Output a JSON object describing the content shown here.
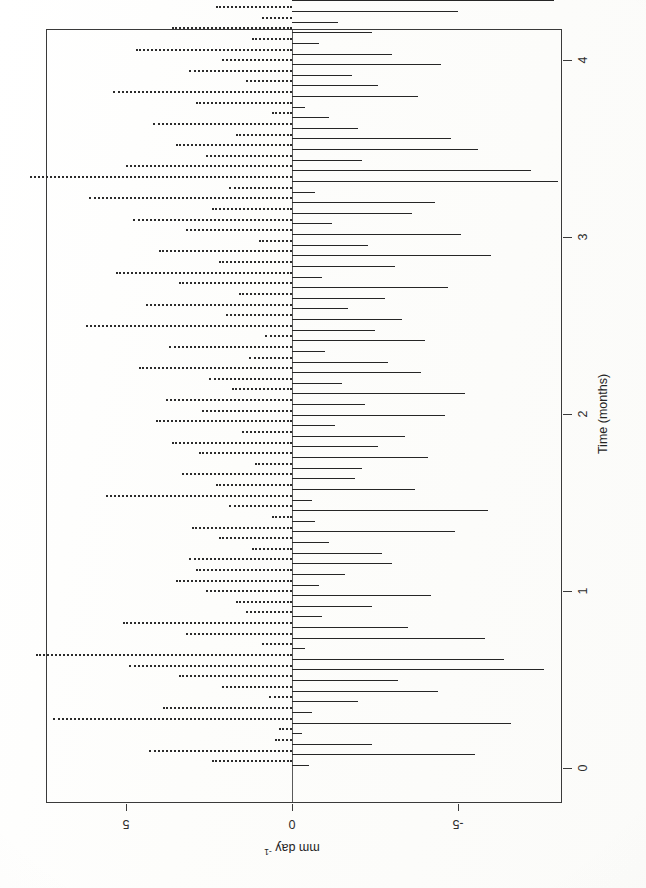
{
  "chart_data": {
    "type": "bar",
    "orientation": "horizontal-bars-rotated-page",
    "title": "",
    "subtitle": "",
    "xlabel": "mm day⁻¹",
    "ylabel": "Time (months)",
    "value_axis": {
      "name": "mm day-1",
      "label": "mm day⁻¹",
      "ticks": [
        5,
        0,
        -5
      ],
      "tick_labels": [
        "5",
        "0",
        "-5"
      ],
      "range": [
        7.8,
        -8.1
      ],
      "direction": "decreasing-left-to-right",
      "label_rotation_deg": 180
    },
    "time_axis": {
      "name": "Time (months)",
      "label": "Time (months)",
      "ticks": [
        0,
        1,
        2,
        3,
        4
      ],
      "tick_labels": [
        "0",
        "1",
        "2",
        "3",
        "4"
      ],
      "range": [
        -0.08,
        4.42
      ],
      "direction": "increasing-bottom-to-top",
      "label_rotation_deg": -90
    },
    "grid": false,
    "legend": null,
    "series": [
      {
        "name": "positive-anomaly",
        "style": "dotted",
        "note": "dotted bars drawn toward the 5 mm/day side"
      },
      {
        "name": "negative-anomaly",
        "style": "solid",
        "note": "solid bars drawn toward the -5 mm/day side"
      }
    ],
    "n_time_steps": 76,
    "bars": [
      {
        "t": 0.02,
        "dotted": 2.4,
        "solid": -0.5
      },
      {
        "t": 0.08,
        "dotted": 4.3,
        "solid": -5.5
      },
      {
        "t": 0.14,
        "dotted": 0.5,
        "solid": -2.4
      },
      {
        "t": 0.2,
        "dotted": 0.4,
        "solid": -0.3
      },
      {
        "t": 0.26,
        "dotted": 7.2,
        "solid": -6.6
      },
      {
        "t": 0.32,
        "dotted": 3.9,
        "solid": -0.6
      },
      {
        "t": 0.38,
        "dotted": 0.7,
        "solid": -2.0
      },
      {
        "t": 0.44,
        "dotted": 2.1,
        "solid": -4.4
      },
      {
        "t": 0.5,
        "dotted": 3.4,
        "solid": -3.2
      },
      {
        "t": 0.56,
        "dotted": 4.9,
        "solid": -7.6
      },
      {
        "t": 0.62,
        "dotted": 7.7,
        "solid": -6.4
      },
      {
        "t": 0.68,
        "dotted": 0.9,
        "solid": -0.4
      },
      {
        "t": 0.74,
        "dotted": 3.2,
        "solid": -5.8
      },
      {
        "t": 0.8,
        "dotted": 5.1,
        "solid": -3.5
      },
      {
        "t": 0.86,
        "dotted": 1.4,
        "solid": -0.9
      },
      {
        "t": 0.92,
        "dotted": 1.7,
        "solid": -2.4
      },
      {
        "t": 0.98,
        "dotted": 2.6,
        "solid": -4.2
      },
      {
        "t": 1.04,
        "dotted": 3.5,
        "solid": -0.8
      },
      {
        "t": 1.1,
        "dotted": 2.9,
        "solid": -1.6
      },
      {
        "t": 1.16,
        "dotted": 3.1,
        "solid": -3.0
      },
      {
        "t": 1.22,
        "dotted": 1.2,
        "solid": -2.7
      },
      {
        "t": 1.28,
        "dotted": 2.2,
        "solid": -1.1
      },
      {
        "t": 1.34,
        "dotted": 3.0,
        "solid": -4.9
      },
      {
        "t": 1.4,
        "dotted": 0.6,
        "solid": -0.7
      },
      {
        "t": 1.46,
        "dotted": 1.9,
        "solid": -5.9
      },
      {
        "t": 1.52,
        "dotted": 5.6,
        "solid": -0.6
      },
      {
        "t": 1.58,
        "dotted": 2.3,
        "solid": -3.7
      },
      {
        "t": 1.64,
        "dotted": 3.3,
        "solid": -1.9
      },
      {
        "t": 1.7,
        "dotted": 1.1,
        "solid": -2.1
      },
      {
        "t": 1.76,
        "dotted": 2.8,
        "solid": -4.1
      },
      {
        "t": 1.82,
        "dotted": 3.6,
        "solid": -2.6
      },
      {
        "t": 1.88,
        "dotted": 1.5,
        "solid": -3.4
      },
      {
        "t": 1.94,
        "dotted": 4.1,
        "solid": -1.3
      },
      {
        "t": 2.0,
        "dotted": 2.7,
        "solid": -4.6
      },
      {
        "t": 2.06,
        "dotted": 3.8,
        "solid": -2.2
      },
      {
        "t": 2.12,
        "dotted": 1.8,
        "solid": -5.2
      },
      {
        "t": 2.18,
        "dotted": 2.5,
        "solid": -1.5
      },
      {
        "t": 2.24,
        "dotted": 4.6,
        "solid": -3.9
      },
      {
        "t": 2.3,
        "dotted": 1.3,
        "solid": -2.9
      },
      {
        "t": 2.36,
        "dotted": 3.7,
        "solid": -1.0
      },
      {
        "t": 2.42,
        "dotted": 0.8,
        "solid": -4.0
      },
      {
        "t": 2.48,
        "dotted": 6.2,
        "solid": -2.5
      },
      {
        "t": 2.54,
        "dotted": 2.0,
        "solid": -3.3
      },
      {
        "t": 2.6,
        "dotted": 4.4,
        "solid": -1.7
      },
      {
        "t": 2.66,
        "dotted": 1.6,
        "solid": -2.8
      },
      {
        "t": 2.72,
        "dotted": 3.4,
        "solid": -4.7
      },
      {
        "t": 2.78,
        "dotted": 5.3,
        "solid": -0.9
      },
      {
        "t": 2.84,
        "dotted": 2.2,
        "solid": -3.1
      },
      {
        "t": 2.9,
        "dotted": 4.0,
        "solid": -6.0
      },
      {
        "t": 2.96,
        "dotted": 1.0,
        "solid": -2.3
      },
      {
        "t": 3.02,
        "dotted": 3.2,
        "solid": -5.1
      },
      {
        "t": 3.08,
        "dotted": 4.8,
        "solid": -1.2
      },
      {
        "t": 3.14,
        "dotted": 2.4,
        "solid": -3.6
      },
      {
        "t": 3.2,
        "dotted": 6.1,
        "solid": -4.3
      },
      {
        "t": 3.26,
        "dotted": 1.9,
        "solid": -0.7
      },
      {
        "t": 3.32,
        "dotted": 7.9,
        "solid": -8.0
      },
      {
        "t": 3.38,
        "dotted": 5.0,
        "solid": -7.2
      },
      {
        "t": 3.44,
        "dotted": 2.6,
        "solid": -2.1
      },
      {
        "t": 3.5,
        "dotted": 3.5,
        "solid": -5.6
      },
      {
        "t": 3.56,
        "dotted": 1.7,
        "solid": -4.8
      },
      {
        "t": 3.62,
        "dotted": 4.2,
        "solid": -2.0
      },
      {
        "t": 3.68,
        "dotted": 0.6,
        "solid": -1.1
      },
      {
        "t": 3.74,
        "dotted": 2.9,
        "solid": -0.4
      },
      {
        "t": 3.8,
        "dotted": 5.4,
        "solid": -3.8
      },
      {
        "t": 3.86,
        "dotted": 1.4,
        "solid": -2.6
      },
      {
        "t": 3.92,
        "dotted": 3.1,
        "solid": -1.8
      },
      {
        "t": 3.98,
        "dotted": 2.1,
        "solid": -4.5
      },
      {
        "t": 4.04,
        "dotted": 4.7,
        "solid": -3.0
      },
      {
        "t": 4.1,
        "dotted": 1.2,
        "solid": -0.8
      },
      {
        "t": 4.16,
        "dotted": 3.6,
        "solid": -2.4
      },
      {
        "t": 4.22,
        "dotted": 0.9,
        "solid": -1.4
      },
      {
        "t": 4.28,
        "dotted": 2.3,
        "solid": -5.0
      },
      {
        "t": 4.34,
        "dotted": 4.5,
        "solid": -7.9
      },
      {
        "t": 4.4,
        "dotted": 0.4,
        "solid": -0.6
      }
    ]
  },
  "axes": {
    "value": {
      "title_plain": "mm day",
      "title_sup": "-1",
      "ticks": [
        {
          "label": "5",
          "value": 5
        },
        {
          "label": "0",
          "value": 0
        },
        {
          "label": "-5",
          "value": -5
        }
      ]
    },
    "time": {
      "title": "Time (months)",
      "ticks": [
        {
          "label": "0",
          "value": 0
        },
        {
          "label": "1",
          "value": 1
        },
        {
          "label": "2",
          "value": 2
        },
        {
          "label": "3",
          "value": 3
        },
        {
          "label": "4",
          "value": 4
        }
      ]
    }
  },
  "style": {
    "ink": "#262626",
    "frame": "#3a3a3a",
    "paper": "#fdfdfc"
  }
}
